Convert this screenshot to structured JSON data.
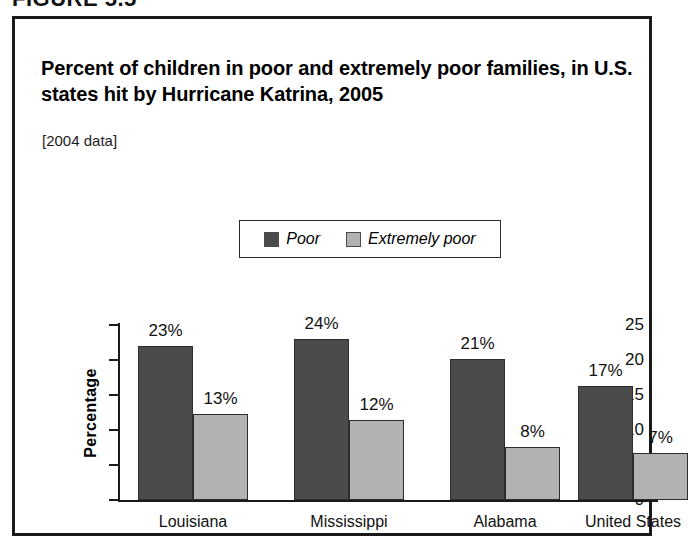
{
  "figure": {
    "number_label": "FIGURE 5.5"
  },
  "chart_data": {
    "type": "bar",
    "title": "Percent of children in poor and extremely poor families, in U.S. states hit by Hurricane Katrina, 2005",
    "subtitle": "[2004 data]",
    "xlabel": "",
    "ylabel": "Percentage",
    "ylim": [
      0,
      25
    ],
    "ytick_labels": [
      "0",
      "5",
      "10",
      "15",
      "20",
      "25"
    ],
    "ytick_values": [
      0,
      5,
      10,
      15,
      20,
      25
    ],
    "grid": false,
    "legend_position": "top-center",
    "categories": [
      "Louisiana",
      "Mississippi",
      "Alabama",
      "United States"
    ],
    "series": [
      {
        "name": "Poor",
        "color": "#4b4b4b",
        "values": [
          23,
          24,
          21,
          17
        ],
        "bar_heights": [
          22.0,
          23.0,
          20.1,
          16.3
        ],
        "data_labels": [
          "23%",
          "24%",
          "21%",
          "17%"
        ]
      },
      {
        "name": "Extremely poor",
        "color": "#b2b2b2",
        "values": [
          13,
          12,
          8,
          7
        ],
        "bar_heights": [
          12.3,
          11.5,
          7.6,
          6.7
        ],
        "data_labels": [
          "13%",
          "12%",
          "8%",
          "7%"
        ]
      }
    ]
  }
}
